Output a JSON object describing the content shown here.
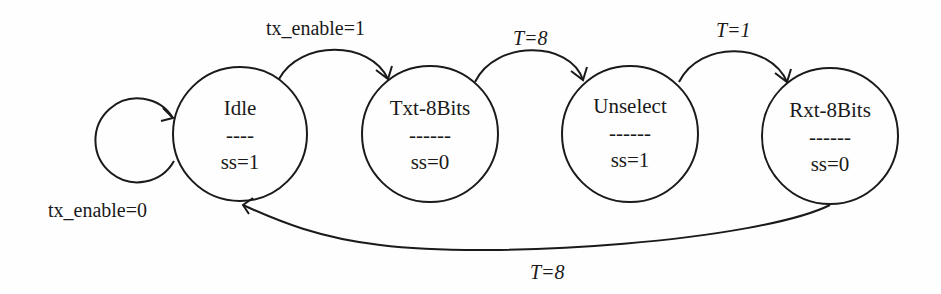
{
  "diagram": {
    "type": "state-machine",
    "states": [
      {
        "id": "idle",
        "name": "Idle",
        "divider": "----",
        "output": "ss=1"
      },
      {
        "id": "txt",
        "name": "Txt-8Bits",
        "divider": "------",
        "output": "ss=0"
      },
      {
        "id": "unselect",
        "name": "Unselect",
        "divider": "------",
        "output": "ss=1"
      },
      {
        "id": "rxt",
        "name": "Rxt-8Bits",
        "divider": "------",
        "output": "ss=0"
      }
    ],
    "transitions": [
      {
        "from": "idle",
        "to": "idle",
        "label": "tx_enable=0"
      },
      {
        "from": "idle",
        "to": "txt",
        "label": "tx_enable=1"
      },
      {
        "from": "txt",
        "to": "unselect",
        "label": "T=8"
      },
      {
        "from": "unselect",
        "to": "rxt",
        "label": "T=1"
      },
      {
        "from": "rxt",
        "to": "idle",
        "label": "T=8"
      }
    ],
    "colors": {
      "stroke": "#1a1a1a",
      "background": "#fefefe"
    }
  }
}
